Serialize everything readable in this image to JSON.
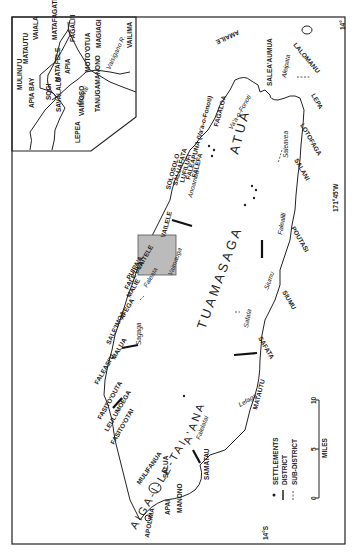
{
  "map": {
    "subject": "Upolu island districts map (rotated 90°)",
    "orientation": "rotated-90-clockwise",
    "districts": [
      "AIGA-I-LE-TAI",
      "A'ANA",
      "TUAMASAGA",
      "ATUA"
    ],
    "settlements_coast_north": [
      "APOLIMA",
      "MANONO",
      "APAI",
      "SALUA",
      "MULIFANUA",
      "FASITO'OTAI",
      "LEULUMOEGA",
      "FASITO'OUTA",
      "FALEASI'U",
      "MALUA",
      "SALE'IMOA",
      "AFEGA",
      "MALIE",
      "FALE'ULA",
      "PUIPA'A",
      "VAITELE",
      "VAILELE",
      "SOLOSOLO",
      "SALUAFATA",
      "LUFILUFI",
      "FALEAPUNA (Va'a-o-Fonoti)",
      "FALEFA",
      "FAGALOA",
      "AMAILE",
      "SALEA'AUMUA",
      "LALOMANU"
    ],
    "settlements_coast_south": [
      "SAMATAU",
      "MATAUTU",
      "SAFATA",
      "SIUMU",
      "POUTASI",
      "SALANI",
      "LOTOFAGA",
      "LEPA",
      "Saleaula"
    ],
    "sub_district_labels": [
      "Falelatai",
      "Lefaga",
      "Safata",
      "Siumu",
      "Falealili",
      "Saleavea",
      "Aleipata",
      "Sagaga",
      "Faleata",
      "Vaimauga",
      "Anoamaa",
      "Va'a-o-Fonoti",
      "Aleipata"
    ],
    "inset": {
      "labels": [
        "MULINU'U",
        "APIA BAY",
        "MATAUTU",
        "VAIALA",
        "MATAFAGATELE",
        "FAGALI'I",
        "SOGI",
        "SAVALALO",
        "MATAFELE",
        "APIA",
        "MOTO'OTUA",
        "MAGIAGI",
        "VAILIMA",
        "VAIMOSO",
        "TANUGAMANONO",
        "LEPEA",
        "Vaisigano R.",
        "Mulivai"
      ]
    },
    "legend": {
      "items": [
        {
          "symbol": "dot",
          "label": "SETTLEMENTS"
        },
        {
          "symbol": "solid-line",
          "label": "DISTRICT"
        },
        {
          "symbol": "dashed-line",
          "label": "SUB-DISTRICT"
        }
      ]
    },
    "scale_bar": {
      "unit": "MILES",
      "ticks": [
        "0",
        "5",
        "10"
      ]
    },
    "graticule": {
      "latitude": "14°S",
      "longitude": "171°45'W",
      "corner": "14°"
    }
  }
}
